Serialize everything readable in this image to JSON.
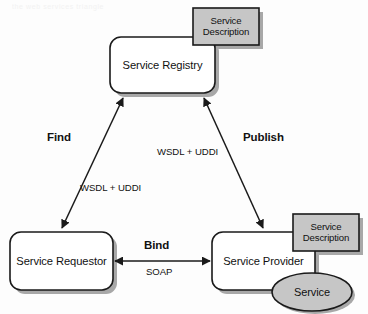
{
  "diagram": {
    "background_color": "#fdfdfd",
    "stroke_color": "#1a1a1a",
    "gray_fill": "#c6c6c6",
    "shadow_color": "#a8a8a8",
    "nodes": [
      {
        "id": "service-registry",
        "label": "Service Registry",
        "shape": "rounded-rectangle",
        "fill": "#ffffff"
      },
      {
        "id": "service-requestor",
        "label": "Service Requestor",
        "shape": "rounded-rectangle",
        "fill": "#ffffff"
      },
      {
        "id": "service-provider",
        "label": "Service Provider",
        "shape": "rounded-rectangle",
        "fill": "#ffffff"
      },
      {
        "id": "service-description-registry",
        "label_line1": "Service",
        "label_line2": "Description",
        "shape": "rectangle",
        "fill": "#c6c6c6"
      },
      {
        "id": "service-description-provider",
        "label_line1": "Service",
        "label_line2": "Description",
        "shape": "rectangle",
        "fill": "#c6c6c6"
      },
      {
        "id": "service",
        "label": "Service",
        "shape": "ellipse",
        "fill": "#c6c6c6"
      }
    ],
    "edges": [
      {
        "id": "find",
        "operation": "Find",
        "protocol": "WSDL + UDDI",
        "from": "service-requestor",
        "to": "service-registry",
        "arrowheads": "both"
      },
      {
        "id": "publish",
        "operation": "Publish",
        "protocol": "WSDL + UDDI",
        "from": "service-provider",
        "to": "service-registry",
        "arrowheads": "both"
      },
      {
        "id": "bind",
        "operation": "Bind",
        "protocol": "SOAP",
        "from": "service-requestor",
        "to": "service-provider",
        "arrowheads": "both"
      }
    ],
    "scan_artifact": "the web services triangle"
  }
}
